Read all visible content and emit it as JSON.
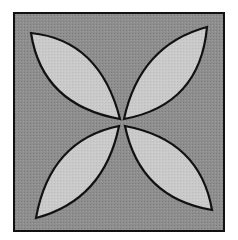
{
  "figure": {
    "colors": {
      "background": "#ffffff",
      "square_fill": "#8e8e8e",
      "petal_fill": "#c9c9c9",
      "stroke": "#111111"
    },
    "square": {
      "x": 14,
      "y": 13,
      "width": 210,
      "height": 218
    },
    "center": {
      "x": 122,
      "y": 122
    },
    "petals": [
      {
        "name": "upper-left",
        "d": "M 31 33 Q 100 40 120 119 Q 42 105 31 33 Z"
      },
      {
        "name": "upper-right",
        "d": "M 207 27 Q 140 45 124 119 Q 200 105 207 27 Z"
      },
      {
        "name": "lower-left",
        "d": "M 36 218 Q 50 140 119 126 Q 104 200 36 218 Z"
      },
      {
        "name": "lower-right",
        "d": "M 212 210 Q 200 140 125 126 Q 140 198 212 210 Z"
      }
    ]
  }
}
